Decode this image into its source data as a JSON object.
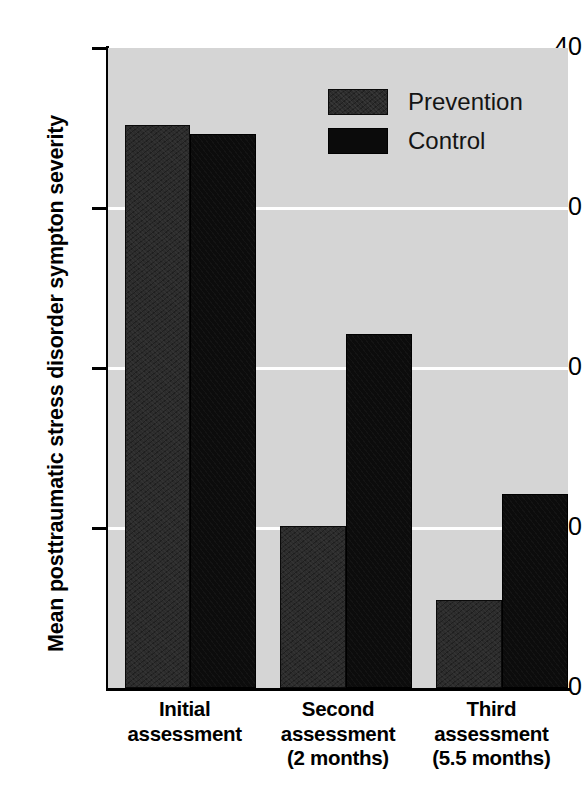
{
  "chart_data": {
    "type": "bar",
    "title": "",
    "subtitle": "",
    "xlabel": "",
    "ylabel": "Mean posttraumatic stress disorder sympton severity",
    "categories": [
      "Initial assessment",
      "Second assessment (2 months)",
      "Third assessment (5.5 months)"
    ],
    "category_lines": [
      [
        "Initial",
        "assessment",
        ""
      ],
      [
        "Second",
        "assessment",
        "(2 months)"
      ],
      [
        "Third",
        "assessment",
        "(5.5 months)"
      ]
    ],
    "series": [
      {
        "name": "Prevention",
        "color": "#2c2c2c",
        "values": [
          35.2,
          10.1,
          5.5
        ]
      },
      {
        "name": "Control",
        "color": "#0c0c0c",
        "values": [
          34.6,
          22.1,
          12.1
        ]
      }
    ],
    "ylim": [
      0,
      40
    ],
    "yticks": [
      0,
      10,
      20,
      30,
      40
    ],
    "ytick_labels": [
      "0",
      "10",
      "20",
      "30",
      "40"
    ],
    "gridlines": [
      10,
      20,
      30
    ],
    "grid": true,
    "grid_color": "#ffffff",
    "plot_background": "#d5d5d5",
    "page_background": "#ffffff",
    "legend_position": "top-right",
    "legend_entries": [
      "Prevention",
      "Control"
    ]
  },
  "axis": {
    "y_title": "Mean posttraumatic stress disorder sympton severity",
    "tick_40": "40",
    "tick_30": "30",
    "tick_20": "20",
    "tick_10": "10",
    "tick_0": "0"
  },
  "legend": {
    "prevention_label": "Prevention",
    "control_label": "Control"
  },
  "categories": [
    {
      "line1": "Initial",
      "line2": "assessment",
      "line3": ""
    },
    {
      "line1": "Second",
      "line2": "assessment",
      "line3": "(2 months)"
    },
    {
      "line1": "Third",
      "line2": "assessment",
      "line3": "(5.5 months)"
    }
  ]
}
